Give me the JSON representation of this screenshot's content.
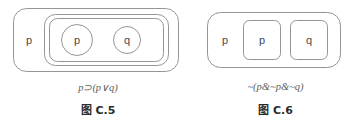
{
  "figure": {
    "background_color": "#ffffff",
    "stroke_color": "#8a8a8a",
    "label_color": "#4a4a4a",
    "formula_color": "#5e5e5e",
    "caption_color": "#2b2b2b"
  },
  "panels": [
    {
      "id": "left",
      "caption": "图 C.5",
      "formula": "p⊃(p∨q)",
      "outer_label": "p",
      "inner_labels": {
        "first": "p",
        "second": "q"
      },
      "inner_shape_type": "circle",
      "nesting_levels": 3
    },
    {
      "id": "right",
      "caption": "图 C.6",
      "formula": "~(p&~p&~q)",
      "outer_label": "p",
      "inner_labels": {
        "first": "p",
        "second": "q"
      },
      "inner_shape_type": "rounded-rect",
      "nesting_levels": 2
    }
  ]
}
